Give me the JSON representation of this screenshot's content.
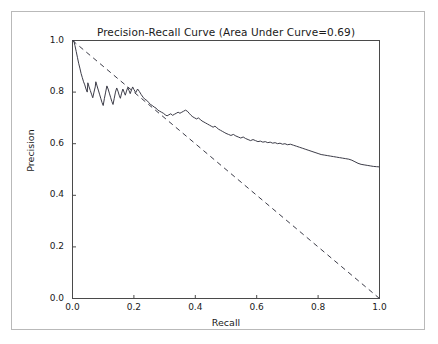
{
  "figure": {
    "background": "#ffffff",
    "frame_color": "#b9b9b9"
  },
  "chart_data": {
    "type": "line",
    "title": "Precision-Recall Curve (Area Under Curve=0.69)",
    "xlabel": "Recall",
    "ylabel": "Precision",
    "xlim": [
      0.0,
      1.0
    ],
    "ylim": [
      0.0,
      1.0
    ],
    "grid": false,
    "legend": null,
    "auc": 0.69,
    "xticks": [
      0.0,
      0.2,
      0.4,
      0.6,
      0.8,
      1.0
    ],
    "xtick_labels": [
      "0.0",
      "0.2",
      "0.4",
      "0.6",
      "0.8",
      "1.0"
    ],
    "yticks": [
      0.0,
      0.2,
      0.4,
      0.6,
      0.8,
      1.0
    ],
    "ytick_labels": [
      "0.0",
      "0.2",
      "0.4",
      "0.6",
      "0.8",
      "1.0"
    ],
    "series": [
      {
        "name": "precision-recall",
        "style": "solid",
        "color": "#3c3c48",
        "width": 1.0,
        "points": [
          [
            0.0,
            1.0
          ],
          [
            0.004,
            1.0
          ],
          [
            0.008,
            0.98
          ],
          [
            0.012,
            0.958
          ],
          [
            0.016,
            0.935
          ],
          [
            0.02,
            0.912
          ],
          [
            0.024,
            0.893
          ],
          [
            0.028,
            0.872
          ],
          [
            0.032,
            0.856
          ],
          [
            0.036,
            0.84
          ],
          [
            0.04,
            0.828
          ],
          [
            0.044,
            0.812
          ],
          [
            0.048,
            0.8
          ],
          [
            0.05,
            0.836
          ],
          [
            0.054,
            0.82
          ],
          [
            0.058,
            0.806
          ],
          [
            0.062,
            0.792
          ],
          [
            0.066,
            0.778
          ],
          [
            0.07,
            0.8
          ],
          [
            0.074,
            0.82
          ],
          [
            0.076,
            0.84
          ],
          [
            0.08,
            0.824
          ],
          [
            0.084,
            0.808
          ],
          [
            0.088,
            0.792
          ],
          [
            0.092,
            0.776
          ],
          [
            0.096,
            0.76
          ],
          [
            0.1,
            0.748
          ],
          [
            0.104,
            0.776
          ],
          [
            0.108,
            0.8
          ],
          [
            0.112,
            0.824
          ],
          [
            0.116,
            0.812
          ],
          [
            0.12,
            0.796
          ],
          [
            0.124,
            0.78
          ],
          [
            0.128,
            0.764
          ],
          [
            0.132,
            0.752
          ],
          [
            0.136,
            0.776
          ],
          [
            0.14,
            0.8
          ],
          [
            0.144,
            0.816
          ],
          [
            0.148,
            0.804
          ],
          [
            0.152,
            0.788
          ],
          [
            0.156,
            0.776
          ],
          [
            0.16,
            0.796
          ],
          [
            0.164,
            0.812
          ],
          [
            0.168,
            0.8
          ],
          [
            0.172,
            0.788
          ],
          [
            0.176,
            0.804
          ],
          [
            0.18,
            0.818
          ],
          [
            0.184,
            0.806
          ],
          [
            0.188,
            0.794
          ],
          [
            0.192,
            0.808
          ],
          [
            0.196,
            0.82
          ],
          [
            0.2,
            0.81
          ],
          [
            0.206,
            0.798
          ],
          [
            0.212,
            0.812
          ],
          [
            0.218,
            0.802
          ],
          [
            0.224,
            0.79
          ],
          [
            0.23,
            0.78
          ],
          [
            0.236,
            0.772
          ],
          [
            0.242,
            0.768
          ],
          [
            0.248,
            0.76
          ],
          [
            0.254,
            0.752
          ],
          [
            0.26,
            0.748
          ],
          [
            0.266,
            0.742
          ],
          [
            0.272,
            0.738
          ],
          [
            0.278,
            0.73
          ],
          [
            0.284,
            0.726
          ],
          [
            0.29,
            0.722
          ],
          [
            0.296,
            0.718
          ],
          [
            0.302,
            0.712
          ],
          [
            0.308,
            0.708
          ],
          [
            0.314,
            0.712
          ],
          [
            0.32,
            0.716
          ],
          [
            0.326,
            0.71
          ],
          [
            0.332,
            0.714
          ],
          [
            0.338,
            0.718
          ],
          [
            0.344,
            0.722
          ],
          [
            0.35,
            0.718
          ],
          [
            0.356,
            0.722
          ],
          [
            0.362,
            0.726
          ],
          [
            0.368,
            0.73
          ],
          [
            0.374,
            0.726
          ],
          [
            0.38,
            0.718
          ],
          [
            0.386,
            0.71
          ],
          [
            0.392,
            0.704
          ],
          [
            0.398,
            0.7
          ],
          [
            0.404,
            0.696
          ],
          [
            0.41,
            0.7
          ],
          [
            0.416,
            0.694
          ],
          [
            0.422,
            0.688
          ],
          [
            0.428,
            0.684
          ],
          [
            0.434,
            0.68
          ],
          [
            0.44,
            0.676
          ],
          [
            0.446,
            0.672
          ],
          [
            0.452,
            0.668
          ],
          [
            0.458,
            0.664
          ],
          [
            0.464,
            0.668
          ],
          [
            0.47,
            0.662
          ],
          [
            0.476,
            0.656
          ],
          [
            0.482,
            0.652
          ],
          [
            0.488,
            0.648
          ],
          [
            0.494,
            0.644
          ],
          [
            0.5,
            0.64
          ],
          [
            0.508,
            0.636
          ],
          [
            0.516,
            0.632
          ],
          [
            0.524,
            0.636
          ],
          [
            0.532,
            0.63
          ],
          [
            0.54,
            0.626
          ],
          [
            0.548,
            0.622
          ],
          [
            0.556,
            0.626
          ],
          [
            0.564,
            0.62
          ],
          [
            0.572,
            0.616
          ],
          [
            0.58,
            0.612
          ],
          [
            0.588,
            0.616
          ],
          [
            0.596,
            0.612
          ],
          [
            0.604,
            0.608
          ],
          [
            0.612,
            0.61
          ],
          [
            0.62,
            0.606
          ],
          [
            0.628,
            0.608
          ],
          [
            0.636,
            0.604
          ],
          [
            0.644,
            0.606
          ],
          [
            0.652,
            0.602
          ],
          [
            0.66,
            0.604
          ],
          [
            0.668,
            0.6
          ],
          [
            0.676,
            0.602
          ],
          [
            0.684,
            0.598
          ],
          [
            0.692,
            0.6
          ],
          [
            0.7,
            0.596
          ],
          [
            0.71,
            0.598
          ],
          [
            0.72,
            0.594
          ],
          [
            0.73,
            0.59
          ],
          [
            0.74,
            0.586
          ],
          [
            0.75,
            0.582
          ],
          [
            0.76,
            0.578
          ],
          [
            0.77,
            0.574
          ],
          [
            0.78,
            0.57
          ],
          [
            0.79,
            0.566
          ],
          [
            0.8,
            0.562
          ],
          [
            0.81,
            0.558
          ],
          [
            0.82,
            0.556
          ],
          [
            0.83,
            0.554
          ],
          [
            0.84,
            0.552
          ],
          [
            0.85,
            0.55
          ],
          [
            0.86,
            0.548
          ],
          [
            0.87,
            0.546
          ],
          [
            0.88,
            0.544
          ],
          [
            0.89,
            0.542
          ],
          [
            0.9,
            0.54
          ],
          [
            0.91,
            0.536
          ],
          [
            0.92,
            0.53
          ],
          [
            0.93,
            0.524
          ],
          [
            0.94,
            0.52
          ],
          [
            0.95,
            0.518
          ],
          [
            0.96,
            0.516
          ],
          [
            0.97,
            0.514
          ],
          [
            0.98,
            0.512
          ],
          [
            0.99,
            0.511
          ],
          [
            1.0,
            0.51
          ]
        ]
      },
      {
        "name": "baseline-diagonal",
        "style": "dashed",
        "color": "#3c3c48",
        "width": 1.0,
        "points": [
          [
            0.0,
            1.0
          ],
          [
            1.0,
            0.0
          ]
        ]
      }
    ]
  }
}
